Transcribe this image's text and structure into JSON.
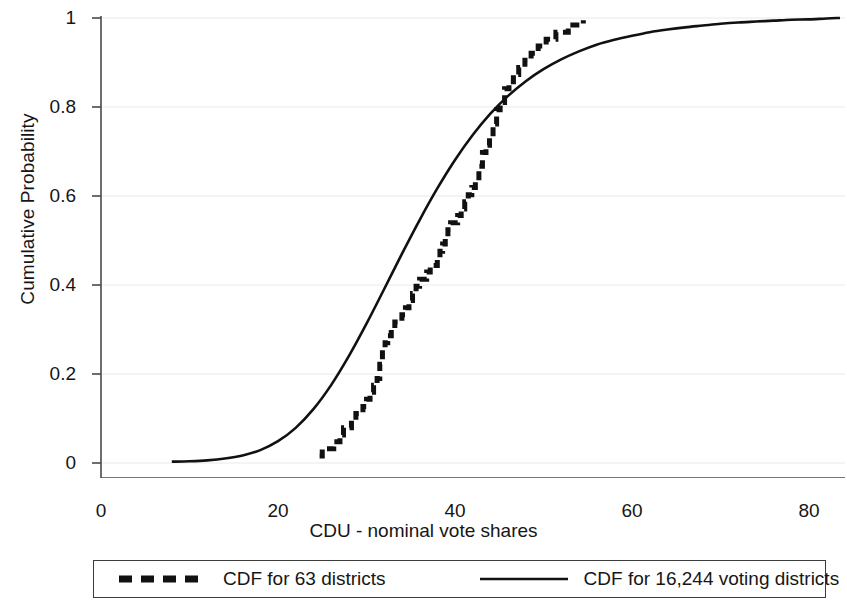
{
  "chart_data": {
    "type": "line",
    "title": "",
    "xlabel": "CDU - nominal vote shares",
    "ylabel": "Cumulative Probability",
    "xlim": [
      0,
      85
    ],
    "ylim": [
      0,
      1.02
    ],
    "xticks": [
      0,
      20,
      40,
      60,
      80
    ],
    "xtick_labels": [
      "0",
      "20",
      "40",
      "60",
      "80"
    ],
    "yticks": [
      0,
      0.2,
      0.4,
      0.6,
      0.8,
      1
    ],
    "ytick_labels": [
      "0",
      "0.2",
      "0.4",
      "0.6",
      "0.8",
      "1"
    ],
    "grid": true,
    "grid_axis": "y",
    "legend_position": "bottom",
    "series": [
      {
        "name": "CDF for 63 districts",
        "style": "dashed",
        "linewidth": 5,
        "color": "#111111",
        "step": true,
        "x": [
          24.7,
          25.0,
          25.6,
          26.3,
          27.0,
          27.4,
          27.9,
          28.3,
          28.8,
          29.2,
          29.6,
          30.0,
          30.4,
          30.8,
          31.2,
          31.5,
          31.8,
          32.1,
          32.4,
          32.8,
          33.2,
          33.6,
          34.0,
          34.4,
          34.8,
          35.2,
          35.6,
          36.0,
          36.4,
          36.8,
          37.2,
          37.6,
          38.0,
          38.3,
          38.6,
          38.9,
          39.2,
          39.5,
          39.9,
          40.3,
          40.7,
          41.1,
          41.5,
          41.9,
          42.3,
          42.7,
          43.1,
          43.5,
          43.9,
          44.3,
          44.7,
          45.1,
          45.6,
          46.1,
          46.6,
          47.2,
          47.9,
          48.6,
          49.4,
          50.3,
          51.4,
          52.8,
          54.5
        ],
        "y": [
          0.016,
          0.032,
          0.032,
          0.048,
          0.063,
          0.079,
          0.079,
          0.095,
          0.111,
          0.111,
          0.127,
          0.143,
          0.159,
          0.175,
          0.19,
          0.222,
          0.254,
          0.27,
          0.286,
          0.302,
          0.317,
          0.317,
          0.333,
          0.349,
          0.365,
          0.381,
          0.397,
          0.413,
          0.413,
          0.429,
          0.444,
          0.444,
          0.46,
          0.476,
          0.492,
          0.508,
          0.524,
          0.54,
          0.54,
          0.556,
          0.571,
          0.587,
          0.603,
          0.619,
          0.635,
          0.667,
          0.698,
          0.714,
          0.73,
          0.762,
          0.794,
          0.81,
          0.841,
          0.857,
          0.873,
          0.889,
          0.905,
          0.921,
          0.937,
          0.952,
          0.968,
          0.984,
          0.995
        ]
      },
      {
        "name": "CDF for 16,244 voting districts",
        "style": "solid",
        "linewidth": 2.6,
        "color": "#111111",
        "step": false,
        "x": [
          8,
          10,
          12,
          14,
          16,
          18,
          20,
          22,
          24,
          26,
          28,
          30,
          32,
          34,
          36,
          38,
          40,
          42,
          44,
          46,
          48,
          50,
          52,
          54,
          56,
          58,
          60,
          62,
          64,
          66,
          68,
          70,
          72,
          74,
          76,
          78,
          80,
          82,
          83.5
        ],
        "y": [
          0.003,
          0.004,
          0.006,
          0.01,
          0.017,
          0.029,
          0.049,
          0.079,
          0.121,
          0.175,
          0.24,
          0.313,
          0.391,
          0.47,
          0.546,
          0.617,
          0.681,
          0.737,
          0.785,
          0.825,
          0.858,
          0.885,
          0.907,
          0.925,
          0.94,
          0.951,
          0.96,
          0.968,
          0.974,
          0.979,
          0.983,
          0.987,
          0.99,
          0.992,
          0.994,
          0.996,
          0.997,
          0.999,
          1.0
        ]
      }
    ]
  },
  "legend": {
    "entries": [
      {
        "label": "CDF for 63 districts",
        "style": "dashed"
      },
      {
        "label": "CDF for 16,244 voting districts",
        "style": "solid"
      }
    ]
  }
}
